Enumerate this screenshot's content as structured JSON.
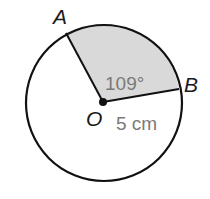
{
  "diagram": {
    "type": "circle-sector",
    "center_label": "O",
    "point_a_label": "A",
    "point_b_label": "B",
    "angle_label": "109°",
    "radius_label": "5 cm",
    "colors": {
      "stroke": "#111111",
      "sector_fill": "#d9d9d9",
      "annotation_text": "#7a7a7a"
    }
  }
}
